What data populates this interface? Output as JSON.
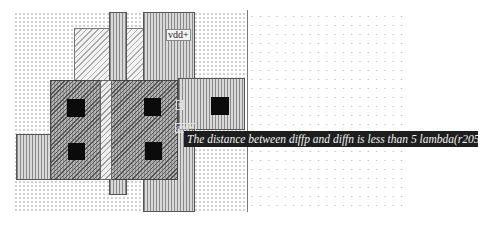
{
  "editor": {
    "layers": {
      "metal": "vertical-stripe",
      "poly": "diagonal-stripe",
      "diffusion": "dense-diagonal",
      "contact": "solid-black"
    },
    "colors": {
      "background": "#ffffff",
      "contact": "#0b0b0b",
      "message_bg": "#1e1e1e",
      "message_fg": "#f3f3f3"
    }
  },
  "labels": {
    "vdd": "vdd+",
    "node_mid": "s",
    "gnd": "gnd+"
  },
  "drc": {
    "message": "The distance between diffp and diffn is less than 5 lambda(r205)"
  }
}
